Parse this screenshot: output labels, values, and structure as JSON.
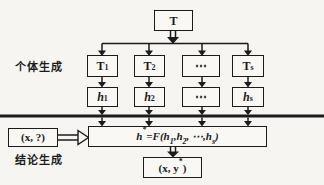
{
  "figure": {
    "type": "diagram",
    "topic": "ensemble learning generation process",
    "colors": {
      "ink": "#1b1b1b",
      "background": "#f6f5f2",
      "box_fill": "#f9f8f5"
    }
  },
  "labels": {
    "stage1": "个体生成",
    "stage2": "结论生成"
  },
  "root_box": {
    "label": "T"
  },
  "trainers": [
    {
      "base": "T",
      "sub": "1"
    },
    {
      "base": "T",
      "sub": "2"
    },
    {
      "base": "⋯",
      "sub": ""
    },
    {
      "base": "T",
      "sub": "s"
    }
  ],
  "learners": [
    {
      "base": "h",
      "sub": "1"
    },
    {
      "base": "h",
      "sub": "2"
    },
    {
      "base": "⋯",
      "sub": ""
    },
    {
      "base": "h",
      "sub": "s"
    }
  ],
  "combiner": {
    "pre": "h",
    "sup": "*",
    "eq": "=F(h",
    "sub1": "1",
    "c1": ",h",
    "sub2": "2",
    "c2": ", ⋯,h",
    "sub3": "s",
    "close": ")"
  },
  "input_box": {
    "label": "(x, ?)"
  },
  "output_box": {
    "pre": "(x, y",
    "sup": "*",
    "post": ")"
  }
}
